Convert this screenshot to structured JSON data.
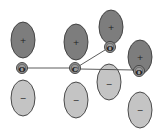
{
  "diagram": {
    "colors": {
      "positive_lobe": "#7d7d7d",
      "negative_lobe": "#c4c4c4",
      "atom": "#9a9a9a",
      "outline": "#3a3a3a"
    },
    "atoms": [
      {
        "id": "o-left",
        "label": "O",
        "x": 22,
        "y": 68
      },
      {
        "id": "c-center",
        "label": "C",
        "x": 75,
        "y": 68
      },
      {
        "id": "o-top-right",
        "label": "O",
        "x": 110,
        "y": 47
      },
      {
        "id": "o-right",
        "label": "O",
        "x": 139,
        "y": 71
      }
    ],
    "lobes": [
      {
        "atom": "o-left",
        "sign": "+",
        "cx": 23,
        "cy": 40,
        "rx": 12,
        "ry": 18
      },
      {
        "atom": "o-left",
        "sign": "−",
        "cx": 23,
        "cy": 98,
        "rx": 12,
        "ry": 18
      },
      {
        "atom": "c-center",
        "sign": "+",
        "cx": 76,
        "cy": 42,
        "rx": 12,
        "ry": 18
      },
      {
        "atom": "c-center",
        "sign": "−",
        "cx": 76,
        "cy": 100,
        "rx": 12,
        "ry": 18
      },
      {
        "atom": "o-top-right",
        "sign": "+",
        "cx": 111,
        "cy": 27,
        "rx": 12,
        "ry": 17
      },
      {
        "atom": "o-top-right",
        "sign": "−",
        "cx": 109,
        "cy": 82,
        "rx": 12,
        "ry": 18
      },
      {
        "atom": "o-right",
        "sign": "+",
        "cx": 140,
        "cy": 57,
        "rx": 12,
        "ry": 17
      },
      {
        "atom": "o-right",
        "sign": "−",
        "cx": 140,
        "cy": 110,
        "rx": 12,
        "ry": 18
      }
    ],
    "labels": {
      "o_left": "O",
      "c_center": "C",
      "o_top_right": "O",
      "o_right": "O",
      "plus": "+",
      "minus": "−"
    }
  }
}
